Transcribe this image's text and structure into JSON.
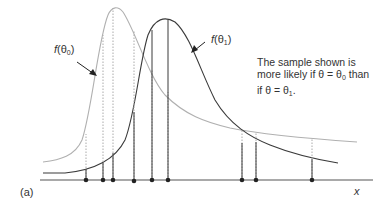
{
  "figure": {
    "panel_label": "(a)",
    "x_axis_label": "x",
    "curve_theta0": {
      "label_func": "f",
      "label_arg": "θ",
      "label_sub": "0",
      "color": "#aaaaaa",
      "style": "light gray"
    },
    "curve_theta1": {
      "label_func": "f",
      "label_arg": "θ",
      "label_sub": "1",
      "color": "#333333",
      "style": "dark"
    },
    "annotation": {
      "line1": "The sample shown is",
      "line2_pre": "more likely if θ = θ",
      "line2_sub": "0",
      "line2_post": " than",
      "line3_pre": "if θ = θ",
      "line3_sub": "1",
      "line3_post": "."
    },
    "sample_points_px": [
      86,
      103,
      113,
      134,
      152,
      168,
      242,
      256,
      312
    ]
  }
}
